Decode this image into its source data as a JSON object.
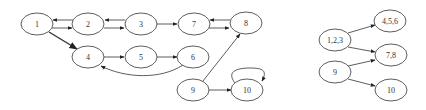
{
  "graph_left": {
    "nodes": [
      {
        "id": "1",
        "label": "1",
        "cx": 37,
        "cy": 24
      },
      {
        "id": "2",
        "label": "2",
        "cx": 88,
        "cy": 24
      },
      {
        "id": "3",
        "label": "3",
        "cx": 141,
        "cy": 24
      },
      {
        "id": "7",
        "label": "7",
        "cx": 194,
        "cy": 24
      },
      {
        "id": "8",
        "label": "8",
        "cx": 246,
        "cy": 23
      },
      {
        "id": "4",
        "label": "4",
        "cx": 88,
        "cy": 57
      },
      {
        "id": "5",
        "label": "5",
        "cx": 141,
        "cy": 57
      },
      {
        "id": "6",
        "label": "6",
        "cx": 193,
        "cy": 57
      },
      {
        "id": "9",
        "label": "9",
        "cx": 193,
        "cy": 90
      },
      {
        "id": "10",
        "label": "10",
        "cx": 247,
        "cy": 90
      }
    ],
    "edges": [
      {
        "from": "2",
        "to": "1"
      },
      {
        "from": "1",
        "to": "2"
      },
      {
        "from": "3",
        "to": "2"
      },
      {
        "from": "2",
        "to": "3"
      },
      {
        "from": "3",
        "to": "7"
      },
      {
        "from": "8",
        "to": "7"
      },
      {
        "from": "7",
        "to": "8"
      },
      {
        "from": "1",
        "to": "4"
      },
      {
        "from": "4",
        "to": "5"
      },
      {
        "from": "5",
        "to": "6"
      },
      {
        "from": "6",
        "to": "4"
      },
      {
        "from": "9",
        "to": "8"
      },
      {
        "from": "9",
        "to": "10"
      },
      {
        "from": "10",
        "to": "10"
      }
    ]
  },
  "graph_right": {
    "nodes": [
      {
        "id": "123",
        "label": "1,2,3",
        "cx": 335,
        "cy": 40
      },
      {
        "id": "456",
        "label": "4,5,6",
        "cx": 390,
        "cy": 21
      },
      {
        "id": "78",
        "label": "7,8",
        "cx": 391,
        "cy": 55
      },
      {
        "id": "9r",
        "label": "9",
        "cx": 335,
        "cy": 72
      },
      {
        "id": "10r",
        "label": "10",
        "cx": 391,
        "cy": 90
      }
    ],
    "edges": [
      {
        "from": "1,2,3",
        "to": "4,5,6"
      },
      {
        "from": "1,2,3",
        "to": "7,8"
      },
      {
        "from": "9",
        "to": "7,8"
      },
      {
        "from": "9",
        "to": "10"
      }
    ]
  }
}
